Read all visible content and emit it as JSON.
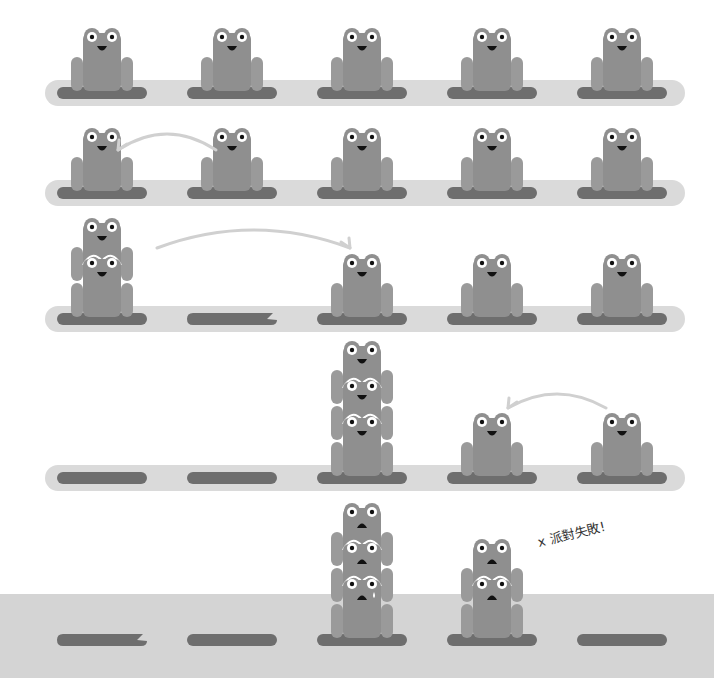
{
  "colors": {
    "background": "#ffffff",
    "water_strip": "#dadada",
    "bottom_ground": "#d4d4d4",
    "pad": "#6e6e6e",
    "frog_body": "#8f8f8f",
    "frog_arm": "#9a9a9a",
    "eye_white": "#ffffff",
    "pupil": "#111111",
    "mouth": "#111111",
    "arrow": "#d0d0d0",
    "tear": "#ffffff"
  },
  "columns_x": [
    102,
    232,
    362,
    492,
    622
  ],
  "rows": [
    {
      "id": "row-1",
      "strip_y": 93,
      "pads": [
        "full",
        "full",
        "full",
        "full",
        "full"
      ],
      "stacks": [
        1,
        1,
        1,
        1,
        1
      ],
      "mood": "happy",
      "arrow": null
    },
    {
      "id": "row-2",
      "strip_y": 193,
      "pads": [
        "full",
        "full",
        "full",
        "full",
        "full"
      ],
      "stacks": [
        1,
        1,
        1,
        1,
        1
      ],
      "mood": "happy",
      "arrow": {
        "from_col": 1,
        "to_col": 0,
        "lift": 22,
        "y": 150
      }
    },
    {
      "id": "row-3",
      "strip_y": 319,
      "pads": [
        "full",
        "bitten",
        "full",
        "full",
        "full"
      ],
      "stacks": [
        2,
        0,
        1,
        1,
        1
      ],
      "mood": "happy",
      "arrow": {
        "from_col": 0,
        "to_col": 2,
        "lift": 26,
        "y": 248,
        "from_x": 157,
        "to_x": 350
      }
    },
    {
      "id": "row-4",
      "strip_y": 478,
      "pads": [
        "full",
        "full",
        "full",
        "full",
        "full"
      ],
      "stacks": [
        0,
        0,
        3,
        1,
        1
      ],
      "mood": "happy",
      "arrow": {
        "from_col": 4,
        "to_col": 3,
        "lift": 18,
        "y": 408
      }
    },
    {
      "id": "row-5",
      "strip_y": 640,
      "pads": [
        "bitten",
        "full",
        "full",
        "full",
        "full"
      ],
      "stacks": [
        0,
        0,
        3,
        2,
        0
      ],
      "mood": "sad",
      "tear_on": {
        "col": 2,
        "level": 0
      },
      "arrow": null
    }
  ],
  "bottom_ground_top": 594,
  "annotation": {
    "text": "x 派對失敗!",
    "x": 540,
    "y": 548
  }
}
